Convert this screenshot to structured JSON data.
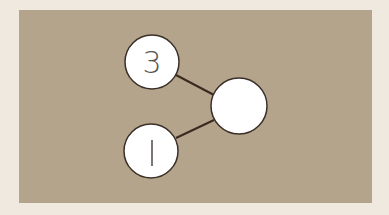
{
  "diagram": {
    "type": "number-bond",
    "colors": {
      "page_background": "#EFE9E0",
      "panel_background": "#B4A48C",
      "node_fill": "#FFFFFF",
      "node_stroke": "#3A3028",
      "edge_stroke": "#3A2A1E",
      "label_color": "#5A5450"
    },
    "nodes": [
      {
        "id": "part-top",
        "label": "3",
        "cx": 152,
        "cy": 62,
        "r": 27
      },
      {
        "id": "part-bottom",
        "label": "1",
        "cx": 151,
        "cy": 151,
        "r": 27
      },
      {
        "id": "whole",
        "label": "",
        "cx": 239,
        "cy": 106,
        "r": 28
      }
    ],
    "edges": [
      {
        "from": "part-top",
        "to": "whole"
      },
      {
        "from": "part-bottom",
        "to": "whole"
      }
    ]
  }
}
